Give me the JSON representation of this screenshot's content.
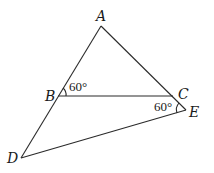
{
  "diagram": {
    "points": {
      "A": {
        "label": "A",
        "x": 101,
        "y": 26
      },
      "B": {
        "label": "B",
        "x": 58,
        "y": 96
      },
      "C": {
        "label": "C",
        "x": 173,
        "y": 96
      },
      "E": {
        "label": "E",
        "x": 186,
        "y": 110
      },
      "D": {
        "label": "D",
        "x": 21,
        "y": 158
      }
    },
    "angles": [
      {
        "vertex": "B",
        "label": "60°"
      },
      {
        "vertex": "E",
        "label": "60°"
      }
    ]
  }
}
